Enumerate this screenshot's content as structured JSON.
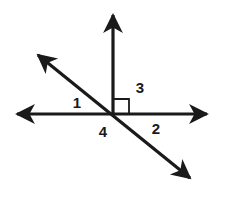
{
  "figure": {
    "background_color": "#ffffff",
    "stroke_color": "#1a1a1a",
    "label_color": "#1a1a1a",
    "vertex": {
      "x": 113,
      "y": 114
    }
  },
  "strokes": {
    "line_width": 3.2,
    "right_angle_width": 1.8
  },
  "lines": [
    {
      "name": "horizontal-line",
      "kind": "double-arrow-line",
      "from": {
        "x": 17,
        "y": 114
      },
      "to": {
        "x": 207,
        "y": 114
      }
    },
    {
      "name": "diagonal-line",
      "kind": "double-arrow-line",
      "from": {
        "x": 38,
        "y": 55
      },
      "to": {
        "x": 190,
        "y": 178
      }
    },
    {
      "name": "vertical-ray",
      "kind": "single-arrow-ray",
      "from": {
        "x": 113,
        "y": 114
      },
      "to": {
        "x": 113,
        "y": 15
      }
    }
  ],
  "right_angle": {
    "name": "right-angle-marker",
    "x": 114,
    "y": 99,
    "size": 15
  },
  "labels": [
    {
      "id": "label-1",
      "text": "1",
      "x": 77,
      "y": 104
    },
    {
      "id": "label-3",
      "text": "3",
      "x": 140,
      "y": 89
    },
    {
      "id": "label-2",
      "text": "2",
      "x": 156,
      "y": 130
    },
    {
      "id": "label-4",
      "text": "4",
      "x": 103,
      "y": 133
    }
  ]
}
